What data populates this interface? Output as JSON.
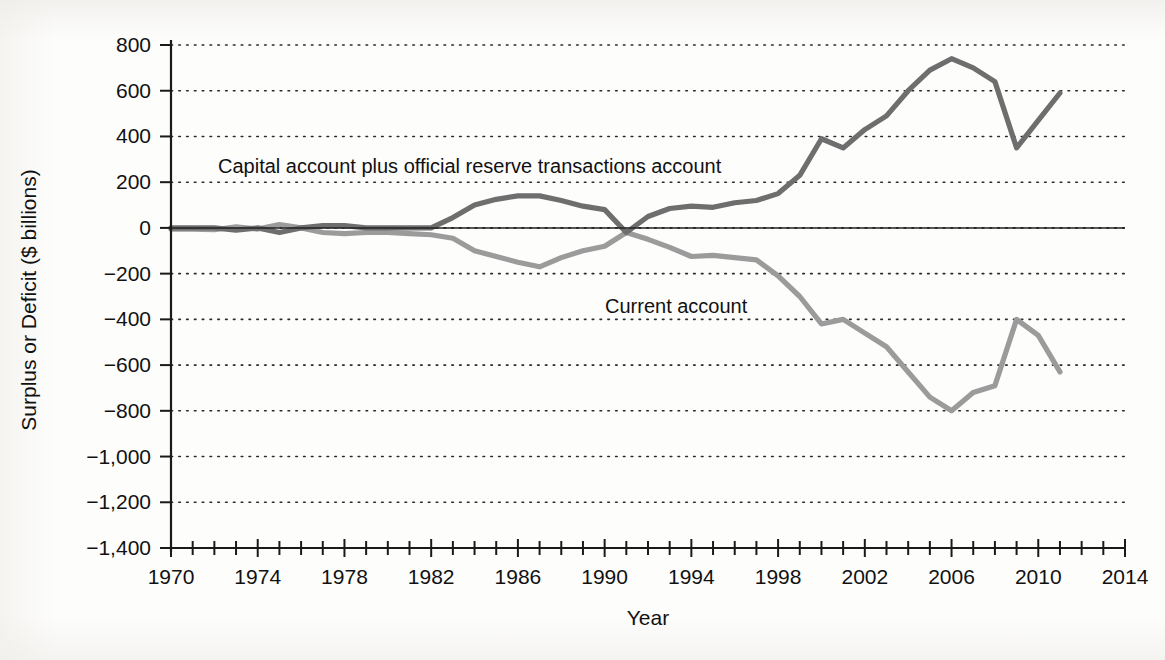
{
  "chart_data": {
    "type": "line",
    "title": "",
    "xlabel": "Year",
    "ylabel": "Surplus or Deficit ($ billions)",
    "xlim": [
      1969,
      2015
    ],
    "ylim": [
      -1400,
      800
    ],
    "grid": true,
    "legend_position": "inline-annotations",
    "y_ticks": [
      800,
      600,
      400,
      200,
      0,
      -200,
      -400,
      -600,
      -800,
      -1000,
      -1200,
      -1400
    ],
    "y_tick_labels": [
      "800",
      "600",
      "400",
      "200",
      "0",
      "−200",
      "−400",
      "−600",
      "−800",
      "−1,000",
      "−1,200",
      "−1,400"
    ],
    "x_ticks": [
      1970,
      1974,
      1978,
      1982,
      1986,
      1990,
      1994,
      1998,
      2002,
      2006,
      2010,
      2014
    ],
    "x_tick_labels": [
      "1970",
      "1974",
      "1978",
      "1982",
      "1986",
      "1990",
      "1994",
      "1998",
      "2002",
      "2006",
      "2010",
      "2014"
    ],
    "x_minor_tick_step": 1,
    "x": [
      1970,
      1971,
      1972,
      1973,
      1974,
      1975,
      1976,
      1977,
      1978,
      1979,
      1980,
      1981,
      1982,
      1983,
      1984,
      1985,
      1986,
      1987,
      1988,
      1989,
      1990,
      1991,
      1992,
      1993,
      1994,
      1995,
      1996,
      1997,
      1998,
      1999,
      2000,
      2001,
      2002,
      2003,
      2004,
      2005,
      2006,
      2007,
      2008,
      2009,
      2010,
      2011
    ],
    "series": [
      {
        "name": "Capital account plus official reserve transactions account",
        "color": "#6e6e6e",
        "values": [
          3,
          2,
          6,
          -7,
          3,
          -18,
          -4,
          14,
          15,
          1,
          2,
          6,
          8,
          44,
          99,
          124,
          147,
          161,
          121,
          100,
          79,
          -3,
          51,
          84,
          122,
          114,
          125,
          141,
          215,
          291,
          411,
          398,
          461,
          523,
          625,
          729,
          812,
          719,
          687,
          378,
          470,
          466
        ],
        "approx_values_read_from_plot": [
          0,
          0,
          0,
          -10,
          0,
          -20,
          0,
          10,
          10,
          0,
          0,
          0,
          0,
          45,
          100,
          125,
          140,
          140,
          120,
          95,
          80,
          -20,
          50,
          85,
          95,
          90,
          110,
          120,
          150,
          230,
          390,
          350,
          430,
          490,
          600,
          690,
          740,
          700,
          640,
          350,
          470,
          590
        ],
        "annotation": "Capital account plus official reserve transactions account",
        "annotation_x": 1972.5,
        "annotation_y": 300
      },
      {
        "name": "Current account",
        "color": "#9b9b9b",
        "values": [
          2,
          -1,
          -6,
          7,
          2,
          18,
          4,
          -14,
          -15,
          -1,
          2,
          5,
          -5,
          -39,
          -94,
          -118,
          -147,
          -161,
          -121,
          -99,
          -79,
          3,
          -50,
          -85,
          -121,
          -114,
          -125,
          -141,
          -215,
          -301,
          -417,
          -398,
          -459,
          -522,
          -625,
          -739,
          -800,
          -710,
          -677,
          -377,
          -471,
          -466
        ],
        "approx_values_read_from_plot": [
          -5,
          -5,
          -8,
          5,
          -5,
          15,
          0,
          -20,
          -25,
          -20,
          -20,
          -25,
          -30,
          -45,
          -100,
          -125,
          -150,
          -170,
          -130,
          -100,
          -80,
          -20,
          -50,
          -85,
          -125,
          -120,
          -130,
          -140,
          -210,
          -300,
          -420,
          -400,
          -460,
          -520,
          -630,
          -740,
          -800,
          -720,
          -690,
          -400,
          -470,
          -630
        ],
        "annotation": "Current account",
        "annotation_x": 1994.2,
        "annotation_y": -395
      }
    ]
  },
  "axes": {
    "y_title": "Surplus or Deficit ($ billions)",
    "x_title": "Year"
  },
  "colors": {
    "capital_account_line": "#6e6e6e",
    "current_account_line": "#9b9b9b",
    "axis": "#1a1a1a",
    "grid": "#2a2a2a",
    "background": "#fdfdfc",
    "text": "#111111"
  }
}
